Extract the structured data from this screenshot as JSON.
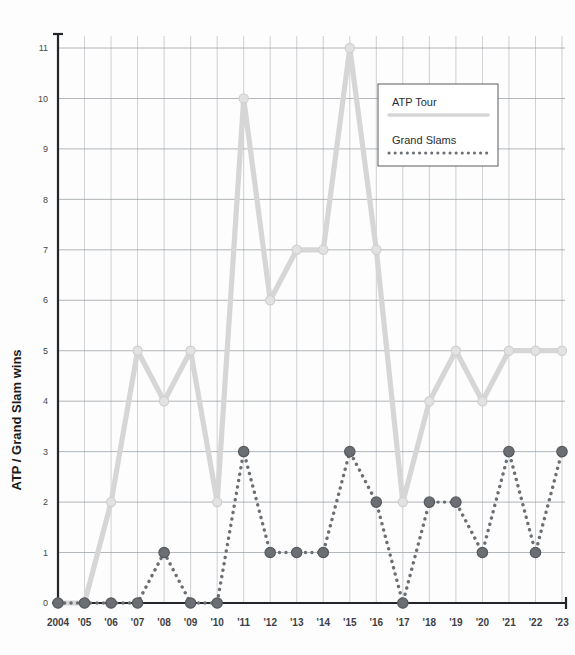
{
  "chart_data": {
    "type": "line",
    "title": "",
    "subtitle": "",
    "xlabel": "",
    "ylabel": "ATP / Grand Slam wins",
    "grid": true,
    "legend_position": "top-right",
    "xlim": [
      2004,
      2023
    ],
    "ylim": [
      0,
      11
    ],
    "y_ticks": [
      0,
      1,
      2,
      3,
      4,
      5,
      6,
      7,
      8,
      9,
      10,
      11
    ],
    "y_tick_labels": [
      "0",
      "1",
      "2",
      "3",
      "4",
      "5",
      "6",
      "7",
      "8",
      "9",
      "10",
      "11"
    ],
    "categories": [
      2004,
      2005,
      2006,
      2007,
      2008,
      2009,
      2010,
      2011,
      2012,
      2013,
      2014,
      2015,
      2016,
      2017,
      2018,
      2019,
      2020,
      2021,
      2022,
      2023
    ],
    "x_tick_labels": [
      "2004",
      "'05",
      "'06",
      "'07",
      "'08",
      "'09",
      "'10",
      "'11",
      "'12",
      "'13",
      "'14",
      "'15",
      "'16",
      "'17",
      "'18",
      "'19",
      "'20",
      "'21",
      "'22",
      "'23"
    ],
    "series": [
      {
        "name": "ATP Tour",
        "color": "#d6d6d6",
        "style": "solid",
        "values": [
          0,
          0,
          2,
          5,
          4,
          5,
          2,
          10,
          6,
          7,
          7,
          11,
          7,
          2,
          4,
          5,
          4,
          5,
          5,
          5
        ]
      },
      {
        "name": "Grand Slams",
        "color": "#6b6f74",
        "style": "dotted",
        "values": [
          0,
          0,
          0,
          0,
          1,
          0,
          0,
          3,
          1,
          1,
          1,
          3,
          2,
          0,
          2,
          2,
          1,
          3,
          1,
          3
        ]
      }
    ]
  },
  "legend": {
    "items": [
      {
        "label": "ATP Tour",
        "color": "#d6d6d6",
        "style": "solid"
      },
      {
        "label": "Grand Slams",
        "color": "#6b6f74",
        "style": "dotted"
      }
    ]
  },
  "axes": {
    "y_axis_title": "ATP / Grand Slam wins",
    "axis_color": "#222529",
    "grid_color": "#9aa0a6"
  }
}
